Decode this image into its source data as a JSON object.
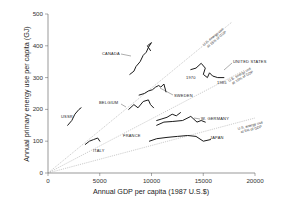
{
  "chart_data": {
    "type": "line",
    "title": "",
    "xlabel": "Annual GDP per capita (1987 U.S.$)",
    "ylabel": "Annual primary energy use per capita (GJ)",
    "xlim": [
      0,
      20000
    ],
    "ylim": [
      0,
      500
    ],
    "x_ticks": [
      0,
      5000,
      10000,
      15000,
      20000
    ],
    "y_ticks": [
      0,
      100,
      200,
      300,
      400,
      500
    ],
    "grid": false,
    "legend": "none (direct labels)",
    "series": [
      {
        "name": "CANADA",
        "points": [
          [
            7900,
            310
          ],
          [
            8300,
            320
          ],
          [
            8500,
            335
          ],
          [
            8900,
            350
          ],
          [
            9200,
            370
          ],
          [
            9500,
            380
          ],
          [
            9700,
            395
          ],
          [
            10000,
            410
          ],
          [
            9600,
            400
          ],
          [
            9900,
            385
          ]
        ]
      },
      {
        "name": "UNITED STATES",
        "points": [
          [
            13800,
            325
          ],
          [
            14300,
            330
          ],
          [
            14800,
            345
          ],
          [
            15200,
            330
          ],
          [
            15000,
            310
          ],
          [
            15400,
            300
          ],
          [
            15600,
            315
          ],
          [
            15900,
            305
          ],
          [
            16400,
            300
          ],
          [
            17000,
            300
          ]
        ]
      },
      {
        "name": "SWEDEN",
        "points": [
          [
            8800,
            245
          ],
          [
            9300,
            250
          ],
          [
            9700,
            258
          ],
          [
            10100,
            262
          ],
          [
            10400,
            270
          ],
          [
            10700,
            275
          ],
          [
            10900,
            270
          ],
          [
            11200,
            280
          ],
          [
            11400,
            255
          ]
        ]
      },
      {
        "name": "BELGIUM",
        "points": [
          [
            7800,
            200
          ],
          [
            8300,
            215
          ],
          [
            8700,
            205
          ],
          [
            9200,
            225
          ],
          [
            9700,
            230
          ],
          [
            9900,
            215
          ],
          [
            10200,
            205
          ]
        ]
      },
      {
        "name": "USSR",
        "points": [
          [
            1900,
            150
          ],
          [
            2300,
            165
          ],
          [
            2600,
            185
          ],
          [
            3000,
            200
          ],
          [
            3200,
            205
          ]
        ]
      },
      {
        "name": "ITALY",
        "points": [
          [
            3600,
            90
          ],
          [
            4000,
            100
          ],
          [
            4400,
            105
          ],
          [
            4800,
            110
          ],
          [
            5000,
            100
          ]
        ]
      },
      {
        "name": "FRANCE",
        "points": [
          [
            10500,
            165
          ],
          [
            11000,
            170
          ],
          [
            11500,
            175
          ],
          [
            12000,
            185
          ],
          [
            12400,
            180
          ],
          [
            12800,
            190
          ]
        ]
      },
      {
        "name": "W. GERMANY",
        "points": [
          [
            10500,
            150
          ],
          [
            11200,
            160
          ],
          [
            12000,
            162
          ],
          [
            13000,
            165
          ],
          [
            13800,
            178
          ],
          [
            14400,
            160
          ],
          [
            14800,
            165
          ],
          [
            15200,
            160
          ]
        ]
      },
      {
        "name": "JAPAN",
        "points": [
          [
            9800,
            100
          ],
          [
            10500,
            108
          ],
          [
            11500,
            112
          ],
          [
            12500,
            115
          ],
          [
            13500,
            118
          ],
          [
            14300,
            115
          ],
          [
            15000,
            100
          ],
          [
            15700,
            105
          ]
        ]
      }
    ],
    "reference_lines": [
      {
        "label": "U.S. energy use at 15% of GDP",
        "points": [
          [
            0,
            0
          ],
          [
            17800,
            475
          ]
        ]
      },
      {
        "label": "U.S. energy use at 10% of GDP",
        "points": [
          [
            0,
            0
          ],
          [
            19000,
            324
          ]
        ]
      },
      {
        "label": "U.S. energy use at 5% of GDP",
        "points": [
          [
            0,
            0
          ],
          [
            20000,
            173
          ]
        ]
      }
    ],
    "annotations": [
      {
        "text": "1970",
        "series": "UNITED STATES",
        "at": [
          13800,
          325
        ]
      },
      {
        "text": "1985",
        "series": "UNITED STATES",
        "at": [
          17000,
          300
        ]
      }
    ]
  },
  "labels": {
    "xlabel": "Annual GDP per capita (1987 U.S.$)",
    "ylabel": "Annual primary energy use per capita (GJ)",
    "x_ticks": [
      "0",
      "5000",
      "10000",
      "15000",
      "20000"
    ],
    "y_ticks": [
      "0",
      "100",
      "200",
      "300",
      "400",
      "500"
    ],
    "ref_15": [
      "U.S. energy use",
      "at 15% of GDP"
    ],
    "ref_10": [
      "U.S. energy use",
      "at 10% of GDP"
    ],
    "ref_5": [
      "U.S. energy use",
      "at 5% of GDP"
    ],
    "countries": {
      "canada": "CANADA",
      "us": "UNITED STATES",
      "sweden": "SWEDEN",
      "belgium": "BELGIUM",
      "ussr": "USSR",
      "italy": "ITALY",
      "france": "FRANCE",
      "wgermany": "W. GERMANY",
      "japan": "JAPAN"
    },
    "year_1970": "1970",
    "year_1985": "1985"
  }
}
